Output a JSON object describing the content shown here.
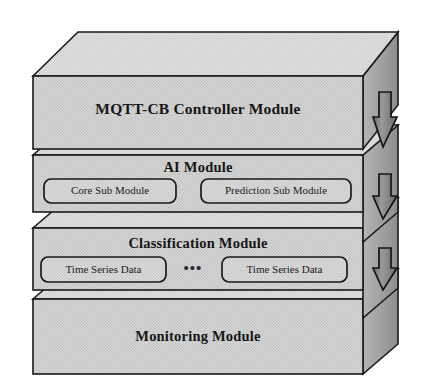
{
  "diagram": {
    "background_color": "#ffffff",
    "palette": {
      "slab_front_fill": "#d2d2d2",
      "slab_top_fill": "#dcdcdc",
      "slab_side_fill": "#a8a8a8",
      "subbox_fill": "#d8d8d8",
      "outline": "#1a1a1a",
      "arrow_fill": "#8f8f8f",
      "text_color": "#151515"
    },
    "layers": [
      {
        "id": "mqtt-cb-controller-module",
        "title": "MQTT-CB Controller Module",
        "order": 1,
        "position": "top",
        "sub_modules": []
      },
      {
        "id": "ai-module",
        "title": "AI Module",
        "order": 2,
        "position": "upper-middle",
        "sub_modules": [
          {
            "id": "core-sub-module",
            "label": "Core Sub Module"
          },
          {
            "id": "prediction-sub-module",
            "label": "Prediction Sub Module"
          }
        ]
      },
      {
        "id": "classification-module",
        "title": "Classification Module",
        "order": 3,
        "position": "lower-middle",
        "separator": "•••",
        "sub_modules": [
          {
            "id": "time-series-data-left",
            "label": "Time Series Data"
          },
          {
            "id": "time-series-data-right",
            "label": "Time Series Data"
          }
        ]
      },
      {
        "id": "monitoring-module",
        "title": "Monitoring Module",
        "order": 4,
        "position": "bottom",
        "sub_modules": []
      }
    ],
    "arrows": [
      {
        "id": "arrow-monitoring-to-classification",
        "direction": "up",
        "from": "Monitoring Module",
        "to": "Classification Module"
      },
      {
        "id": "arrow-classification-to-ai",
        "direction": "up",
        "from": "Classification Module",
        "to": "AI Module"
      },
      {
        "id": "arrow-ai-to-controller",
        "direction": "up",
        "from": "AI Module",
        "to": "MQTT-CB Controller Module"
      }
    ]
  }
}
